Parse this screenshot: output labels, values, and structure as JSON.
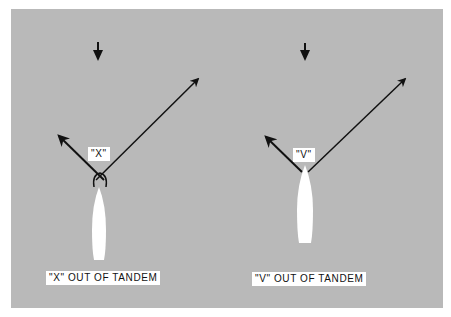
{
  "figure": {
    "background_color": "#b9b9b9",
    "panels": [
      {
        "id": "x-out-of-tandem",
        "tag_label": "\"X\"",
        "caption": "\"X\" OUT OF TANDEM",
        "wind_arrow": "down-arrow",
        "line_configuration": "crossed"
      },
      {
        "id": "v-out-of-tandem",
        "tag_label": "\"V\"",
        "caption": "\"V\" OUT OF TANDEM",
        "wind_arrow": "down-arrow",
        "line_configuration": "diverging"
      }
    ]
  }
}
